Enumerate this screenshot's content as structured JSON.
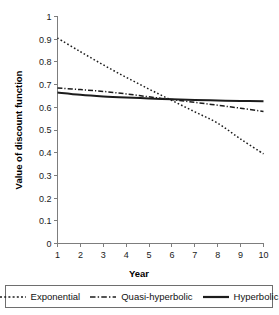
{
  "chart_data": {
    "type": "line",
    "title": "",
    "xlabel": "Year",
    "ylabel": "Value of discount function",
    "xlim": [
      1,
      10
    ],
    "ylim": [
      0,
      1
    ],
    "grid": false,
    "legend_position": "bottom",
    "x": [
      1,
      2,
      3,
      4,
      5,
      6,
      7,
      8,
      9,
      10
    ],
    "xticks": [
      "1",
      "2",
      "3",
      "4",
      "5",
      "6",
      "7",
      "8",
      "9",
      "10"
    ],
    "yticks": [
      "0",
      "0.1",
      "0.2",
      "0.3",
      "0.4",
      "0.5",
      "0.6",
      "0.7",
      "0.8",
      "0.9",
      "1"
    ],
    "series": [
      {
        "name": "Exponential",
        "style": "dashed",
        "values": [
          0.905,
          0.845,
          0.787,
          0.732,
          0.68,
          0.63,
          0.58,
          0.53,
          0.46,
          0.395
        ]
      },
      {
        "name": "Quasi-hyperbolic",
        "style": "dash-dot",
        "values": [
          0.685,
          0.678,
          0.67,
          0.659,
          0.646,
          0.634,
          0.622,
          0.609,
          0.596,
          0.582
        ]
      },
      {
        "name": "Hyperbolic",
        "style": "solid",
        "values": [
          0.665,
          0.655,
          0.648,
          0.643,
          0.639,
          0.635,
          0.632,
          0.63,
          0.628,
          0.627
        ]
      }
    ]
  },
  "legend": {
    "items": [
      {
        "label": "Exponential",
        "style": "dashed"
      },
      {
        "label": "Quasi-hyperbolic",
        "style": "dash-dot"
      },
      {
        "label": "Hyperbolic",
        "style": "solid"
      }
    ]
  },
  "axes": {
    "x_title": "Year",
    "y_title": "Value of discount function"
  }
}
